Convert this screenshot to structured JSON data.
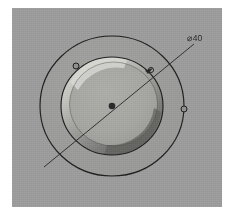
{
  "page": {
    "background_color": "#ffffff"
  },
  "viewport": {
    "name": "cad-3d-viewport",
    "background_color": "#9b9b9b",
    "x": 12,
    "y": 8,
    "width": 210,
    "height": 199
  },
  "model": {
    "description": "Circular plate with counterbored central hole, isometric shaded view",
    "center": {
      "x": 100,
      "y": 98
    },
    "outer_plate_circle": {
      "name": "outer-plate-edge",
      "rx": 72,
      "ry": 70,
      "stroke_color": "#1f1f1f"
    },
    "bore_circle": {
      "name": "counterbore-edge",
      "rx": 51,
      "ry": 49,
      "stroke_color": "#1f1f1f",
      "floor_color": "#a5a5a5",
      "highlight_color": "#cfcfcb",
      "shadow_color": "#6d6d6d"
    },
    "center_point": {
      "name": "center-point",
      "color": "#2a2a2a",
      "radius": 3
    },
    "markers": [
      {
        "name": "bore-rim-marker-upper-left",
        "x": 64,
        "y": 58,
        "r": 3
      },
      {
        "name": "leader-bore-intersection-marker",
        "x": 139,
        "y": 62,
        "r": 3
      },
      {
        "name": "outer-edge-marker-right",
        "x": 172,
        "y": 101,
        "r": 3
      }
    ]
  },
  "annotation": {
    "leader_line": {
      "name": "diameter-leader-line",
      "x1": 32,
      "y1": 159,
      "x2": 182,
      "y2": 36,
      "stroke_color": "#2b2b2b"
    },
    "dimension": {
      "name": "diameter-dimension-label",
      "symbol": "⌀",
      "value": "40",
      "text": "⌀40",
      "x": 183,
      "y": 33
    }
  }
}
